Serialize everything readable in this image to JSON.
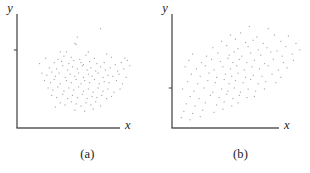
{
  "figure": {
    "background": "#ffffff",
    "point_color": "#a8a8ac",
    "axis_color": "#58585c",
    "text_color": "#1b1b1b"
  },
  "panels": [
    {
      "id": "a",
      "caption": "(a)",
      "xlabel": "x",
      "ylabel": "y",
      "axis": {
        "x_from": 17,
        "x_to": 120,
        "y_from": 128,
        "y_to": 14,
        "y_tick_at": 50
      }
    },
    {
      "id": "b",
      "caption": "(b)",
      "xlabel": "x",
      "ylabel": "y",
      "axis": {
        "x_from": 20,
        "x_to": 127,
        "y_from": 128,
        "y_to": 14,
        "y_tick_at": 88
      }
    }
  ],
  "chart_data": [
    {
      "type": "scatter",
      "title": "(a)",
      "xlabel": "x",
      "ylabel": "y",
      "grid": false,
      "legend": "none",
      "axis_ticks": {
        "x": [],
        "y": [
          "unlabeled tick"
        ]
      },
      "annotation": "Weak positive association; diffuse round cloud of points",
      "xlim": [
        0,
        100
      ],
      "ylim": [
        0,
        100
      ],
      "points": [
        [
          66,
          90
        ],
        [
          47,
          82
        ],
        [
          45,
          76
        ],
        [
          46,
          75
        ],
        [
          33,
          68
        ],
        [
          38,
          68
        ],
        [
          56,
          68
        ],
        [
          71,
          66
        ],
        [
          75,
          63
        ],
        [
          21,
          62
        ],
        [
          31,
          61
        ],
        [
          36,
          64
        ],
        [
          42,
          63
        ],
        [
          49,
          61
        ],
        [
          54,
          65
        ],
        [
          61,
          62
        ],
        [
          86,
          62
        ],
        [
          88,
          60
        ],
        [
          16,
          57
        ],
        [
          28,
          58
        ],
        [
          34,
          59
        ],
        [
          40,
          57
        ],
        [
          44,
          60
        ],
        [
          50,
          58
        ],
        [
          52,
          56
        ],
        [
          57,
          59
        ],
        [
          63,
          57
        ],
        [
          69,
          58
        ],
        [
          78,
          56
        ],
        [
          83,
          58
        ],
        [
          90,
          55
        ],
        [
          24,
          53
        ],
        [
          30,
          52
        ],
        [
          35,
          55
        ],
        [
          39,
          51
        ],
        [
          43,
          54
        ],
        [
          47,
          52
        ],
        [
          51,
          55
        ],
        [
          55,
          51
        ],
        [
          58,
          53
        ],
        [
          62,
          50
        ],
        [
          66,
          54
        ],
        [
          70,
          51
        ],
        [
          74,
          53
        ],
        [
          80,
          50
        ],
        [
          85,
          52
        ],
        [
          18,
          48
        ],
        [
          22,
          46
        ],
        [
          26,
          49
        ],
        [
          29,
          45
        ],
        [
          32,
          48
        ],
        [
          37,
          44
        ],
        [
          41,
          47
        ],
        [
          45,
          45
        ],
        [
          48,
          48
        ],
        [
          52,
          44
        ],
        [
          56,
          47
        ],
        [
          59,
          45
        ],
        [
          64,
          48
        ],
        [
          68,
          44
        ],
        [
          72,
          46
        ],
        [
          76,
          45
        ],
        [
          81,
          47
        ],
        [
          87,
          44
        ],
        [
          20,
          41
        ],
        [
          25,
          39
        ],
        [
          28,
          42
        ],
        [
          33,
          38
        ],
        [
          38,
          41
        ],
        [
          42,
          39
        ],
        [
          46,
          42
        ],
        [
          50,
          38
        ],
        [
          53,
          41
        ],
        [
          57,
          39
        ],
        [
          61,
          42
        ],
        [
          65,
          38
        ],
        [
          69,
          40
        ],
        [
          73,
          39
        ],
        [
          79,
          41
        ],
        [
          84,
          38
        ],
        [
          23,
          34
        ],
        [
          27,
          32
        ],
        [
          31,
          35
        ],
        [
          36,
          31
        ],
        [
          40,
          34
        ],
        [
          44,
          32
        ],
        [
          48,
          35
        ],
        [
          52,
          31
        ],
        [
          56,
          33
        ],
        [
          60,
          30
        ],
        [
          64,
          34
        ],
        [
          68,
          31
        ],
        [
          72,
          33
        ],
        [
          77,
          30
        ],
        [
          82,
          33
        ],
        [
          26,
          27
        ],
        [
          30,
          25
        ],
        [
          35,
          28
        ],
        [
          39,
          24
        ],
        [
          43,
          27
        ],
        [
          47,
          25
        ],
        [
          51,
          28
        ],
        [
          55,
          24
        ],
        [
          59,
          26
        ],
        [
          63,
          25
        ],
        [
          67,
          27
        ],
        [
          71,
          24
        ],
        [
          75,
          26
        ],
        [
          33,
          20
        ],
        [
          37,
          18
        ],
        [
          42,
          21
        ],
        [
          46,
          19
        ],
        [
          50,
          17
        ],
        [
          54,
          20
        ],
        [
          58,
          18
        ],
        [
          62,
          21
        ],
        [
          66,
          17
        ],
        [
          29,
          16
        ],
        [
          45,
          13
        ],
        [
          53,
          12
        ],
        [
          60,
          14
        ]
      ]
    },
    {
      "type": "scatter",
      "title": "(b)",
      "xlabel": "x",
      "ylabel": "y",
      "grid": false,
      "legend": "none",
      "axis_ticks": {
        "x": [],
        "y": [
          "unlabeled tick"
        ]
      },
      "annotation": "Stronger positive linear association; elongated upward-sloping cloud",
      "xlim": [
        0,
        100
      ],
      "ylim": [
        0,
        100
      ],
      "points": [
        [
          59,
          92
        ],
        [
          74,
          90
        ],
        [
          44,
          84
        ],
        [
          52,
          86
        ],
        [
          65,
          82
        ],
        [
          79,
          84
        ],
        [
          90,
          83
        ],
        [
          37,
          78
        ],
        [
          48,
          80
        ],
        [
          56,
          77
        ],
        [
          62,
          79
        ],
        [
          70,
          76
        ],
        [
          84,
          78
        ],
        [
          96,
          76
        ],
        [
          30,
          72
        ],
        [
          41,
          74
        ],
        [
          50,
          71
        ],
        [
          58,
          73
        ],
        [
          66,
          70
        ],
        [
          73,
          72
        ],
        [
          81,
          69
        ],
        [
          88,
          73
        ],
        [
          99,
          70
        ],
        [
          14,
          66
        ],
        [
          25,
          64
        ],
        [
          34,
          67
        ],
        [
          43,
          65
        ],
        [
          47,
          68
        ],
        [
          53,
          64
        ],
        [
          60,
          67
        ],
        [
          68,
          65
        ],
        [
          76,
          68
        ],
        [
          85,
          64
        ],
        [
          93,
          66
        ],
        [
          11,
          60
        ],
        [
          21,
          58
        ],
        [
          29,
          61
        ],
        [
          36,
          59
        ],
        [
          42,
          62
        ],
        [
          46,
          58
        ],
        [
          51,
          61
        ],
        [
          57,
          58
        ],
        [
          63,
          60
        ],
        [
          71,
          57
        ],
        [
          78,
          61
        ],
        [
          86,
          58
        ],
        [
          94,
          60
        ],
        [
          8,
          54
        ],
        [
          17,
          52
        ],
        [
          24,
          55
        ],
        [
          31,
          51
        ],
        [
          38,
          54
        ],
        [
          44,
          52
        ],
        [
          49,
          55
        ],
        [
          55,
          51
        ],
        [
          61,
          54
        ],
        [
          67,
          52
        ],
        [
          74,
          55
        ],
        [
          82,
          51
        ],
        [
          89,
          53
        ],
        [
          13,
          47
        ],
        [
          20,
          45
        ],
        [
          27,
          48
        ],
        [
          33,
          44
        ],
        [
          40,
          47
        ],
        [
          45,
          45
        ],
        [
          50,
          48
        ],
        [
          56,
          44
        ],
        [
          62,
          46
        ],
        [
          69,
          45
        ],
        [
          77,
          47
        ],
        [
          84,
          44
        ],
        [
          10,
          40
        ],
        [
          18,
          38
        ],
        [
          26,
          41
        ],
        [
          32,
          39
        ],
        [
          39,
          42
        ],
        [
          43,
          38
        ],
        [
          48,
          41
        ],
        [
          54,
          39
        ],
        [
          60,
          42
        ],
        [
          66,
          38
        ],
        [
          72,
          40
        ],
        [
          80,
          39
        ],
        [
          6,
          33
        ],
        [
          15,
          31
        ],
        [
          23,
          34
        ],
        [
          30,
          30
        ],
        [
          37,
          33
        ],
        [
          42,
          31
        ],
        [
          47,
          34
        ],
        [
          52,
          30
        ],
        [
          58,
          33
        ],
        [
          64,
          31
        ],
        [
          71,
          33
        ],
        [
          12,
          26
        ],
        [
          19,
          24
        ],
        [
          28,
          27
        ],
        [
          35,
          25
        ],
        [
          41,
          28
        ],
        [
          46,
          24
        ],
        [
          51,
          27
        ],
        [
          57,
          25
        ],
        [
          63,
          26
        ],
        [
          9,
          19
        ],
        [
          16,
          17
        ],
        [
          24,
          20
        ],
        [
          33,
          18
        ],
        [
          39,
          21
        ],
        [
          45,
          17
        ],
        [
          50,
          20
        ],
        [
          7,
          12
        ],
        [
          14,
          10
        ],
        [
          22,
          13
        ],
        [
          31,
          11
        ],
        [
          38,
          14
        ],
        [
          5,
          6
        ],
        [
          12,
          4
        ],
        [
          20,
          7
        ]
      ]
    }
  ]
}
